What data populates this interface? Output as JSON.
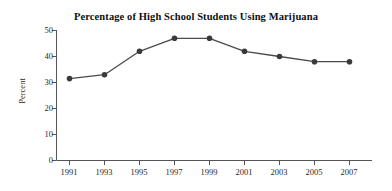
{
  "chart_data": {
    "type": "line",
    "title": "Percentage of High School Students Using Marijuana",
    "xlabel": "",
    "ylabel": "Percent",
    "categories": [
      "1991",
      "1993",
      "1995",
      "1997",
      "1999",
      "2001",
      "2003",
      "2005",
      "2007"
    ],
    "values": [
      31.5,
      33,
      42,
      47,
      47,
      42,
      40,
      38,
      38
    ],
    "series": [
      {
        "name": "Percentage of High School Students Using Marijuana",
        "values": [
          31.5,
          33,
          42,
          47,
          47,
          42,
          40,
          38,
          38
        ]
      }
    ],
    "ylim": [
      0,
      50
    ],
    "y_ticks": [
      "0",
      "10",
      "20",
      "30",
      "40",
      "50"
    ],
    "y_tick_values": [
      0,
      10,
      20,
      30,
      40,
      50
    ],
    "x_ticks": [
      "1991",
      "1993",
      "1995",
      "1997",
      "1999",
      "2001",
      "2003",
      "2005",
      "2007"
    ],
    "grid": false,
    "legend": false,
    "legend_position": "none",
    "marker": "filled-circle",
    "line_color": "#4a4a4a",
    "marker_color": "#3a3a3a",
    "axis_color": "#555555",
    "background_color": "#ffffff"
  },
  "axes": {
    "y_title": "Percent"
  }
}
